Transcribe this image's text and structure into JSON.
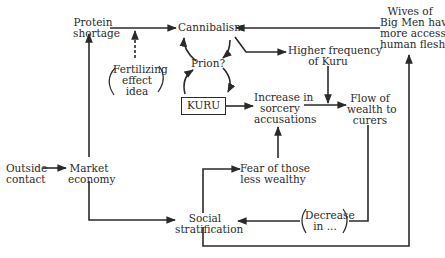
{
  "diagram": {
    "nodes": {
      "protein_shortage": {
        "lines": [
          "Protein",
          "shortage"
        ]
      },
      "cannibalism": {
        "lines": [
          "Cannibalism"
        ]
      },
      "wives_big_men": {
        "lines": [
          "Wives of",
          "Big Men have",
          "more access to",
          "human flesh"
        ]
      },
      "higher_frequency_kuru": {
        "lines": [
          "Higher frequency",
          "of Kuru"
        ]
      },
      "fertilizing_effect": {
        "lines": [
          "Fertilizing",
          "effect",
          "idea"
        ]
      },
      "prion": {
        "lines": [
          "Prion?"
        ]
      },
      "kuru": {
        "lines": [
          "KURU"
        ]
      },
      "increase_sorcery": {
        "lines": [
          "Increase in",
          "sorcery",
          "accusations"
        ]
      },
      "flow_wealth": {
        "lines": [
          "Flow of",
          "wealth to",
          "curers"
        ]
      },
      "outside_contact": {
        "lines": [
          "Outside",
          "contact"
        ]
      },
      "market_economy": {
        "lines": [
          "Market",
          "economy"
        ]
      },
      "fear_less_wealthy": {
        "lines": [
          "Fear of those",
          "less wealthy"
        ]
      },
      "social_stratification": {
        "lines": [
          "Social",
          "stratification"
        ]
      },
      "decrease_in": {
        "lines": [
          "Decrease",
          "in ..."
        ]
      }
    },
    "colors": {
      "ink": "#2a2a2a",
      "background": "#ffffff"
    }
  }
}
